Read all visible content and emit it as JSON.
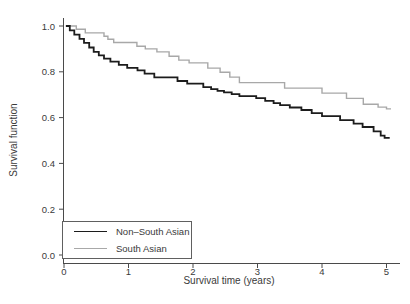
{
  "chart_data": {
    "type": "line",
    "subtype": "kaplan-meier-step",
    "title": "",
    "xlabel": "Survival time (years)",
    "ylabel": "Survival function",
    "xlim": [
      0,
      5
    ],
    "ylim": [
      0,
      1
    ],
    "grid": false,
    "legend_position": "bottom-left-inside",
    "axis_color": "#4a4a4a",
    "x_ticks": [
      {
        "label": "0",
        "value": 0
      },
      {
        "label": "1",
        "value": 1
      },
      {
        "label": "2",
        "value": 2
      },
      {
        "label": "3",
        "value": 3
      },
      {
        "label": "4",
        "value": 4
      },
      {
        "label": "5",
        "value": 5
      }
    ],
    "y_ticks": [
      {
        "label": "0.0",
        "value": 0
      },
      {
        "label": "0.2",
        "value": 0.2
      },
      {
        "label": "0.4",
        "value": 0.4
      },
      {
        "label": "0.6",
        "value": 0.6
      },
      {
        "label": "0.8",
        "value": 0.8
      },
      {
        "label": "1.0",
        "value": 1
      }
    ],
    "series": [
      {
        "name": "Non–South Asian",
        "color": "#1c1c1c",
        "width": 1.8,
        "points": [
          [
            0.03,
            1.0
          ],
          [
            0.09,
            0.981
          ],
          [
            0.16,
            0.962
          ],
          [
            0.24,
            0.944
          ],
          [
            0.31,
            0.926
          ],
          [
            0.39,
            0.906
          ],
          [
            0.46,
            0.887
          ],
          [
            0.54,
            0.872
          ],
          [
            0.62,
            0.857
          ],
          [
            0.72,
            0.844
          ],
          [
            0.85,
            0.83
          ],
          [
            0.98,
            0.817
          ],
          [
            1.14,
            0.806
          ],
          [
            1.25,
            0.792
          ],
          [
            1.4,
            0.776
          ],
          [
            1.76,
            0.76
          ],
          [
            1.91,
            0.748
          ],
          [
            2.16,
            0.733
          ],
          [
            2.28,
            0.724
          ],
          [
            2.38,
            0.717
          ],
          [
            2.48,
            0.71
          ],
          [
            2.6,
            0.702
          ],
          [
            2.72,
            0.694
          ],
          [
            2.98,
            0.685
          ],
          [
            3.12,
            0.673
          ],
          [
            3.25,
            0.663
          ],
          [
            3.35,
            0.654
          ],
          [
            3.5,
            0.644
          ],
          [
            3.68,
            0.633
          ],
          [
            3.84,
            0.619
          ],
          [
            4.0,
            0.606
          ],
          [
            4.28,
            0.589
          ],
          [
            4.49,
            0.574
          ],
          [
            4.63,
            0.559
          ],
          [
            4.8,
            0.54
          ],
          [
            4.91,
            0.521
          ],
          [
            4.97,
            0.512
          ],
          [
            5.05,
            0.512
          ]
        ]
      },
      {
        "name": "South Asian",
        "color": "#a8a8a8",
        "width": 1.4,
        "points": [
          [
            0.03,
            1.0
          ],
          [
            0.19,
            0.986
          ],
          [
            0.33,
            0.97
          ],
          [
            0.62,
            0.955
          ],
          [
            0.68,
            0.942
          ],
          [
            0.77,
            0.928
          ],
          [
            1.13,
            0.912
          ],
          [
            1.26,
            0.9
          ],
          [
            1.44,
            0.887
          ],
          [
            1.63,
            0.868
          ],
          [
            1.78,
            0.851
          ],
          [
            1.94,
            0.839
          ],
          [
            2.23,
            0.816
          ],
          [
            2.42,
            0.798
          ],
          [
            2.57,
            0.777
          ],
          [
            2.72,
            0.753
          ],
          [
            3.42,
            0.729
          ],
          [
            4.0,
            0.707
          ],
          [
            4.38,
            0.684
          ],
          [
            4.64,
            0.658
          ],
          [
            4.87,
            0.646
          ],
          [
            5.0,
            0.638
          ],
          [
            5.07,
            0.638
          ]
        ]
      }
    ]
  }
}
